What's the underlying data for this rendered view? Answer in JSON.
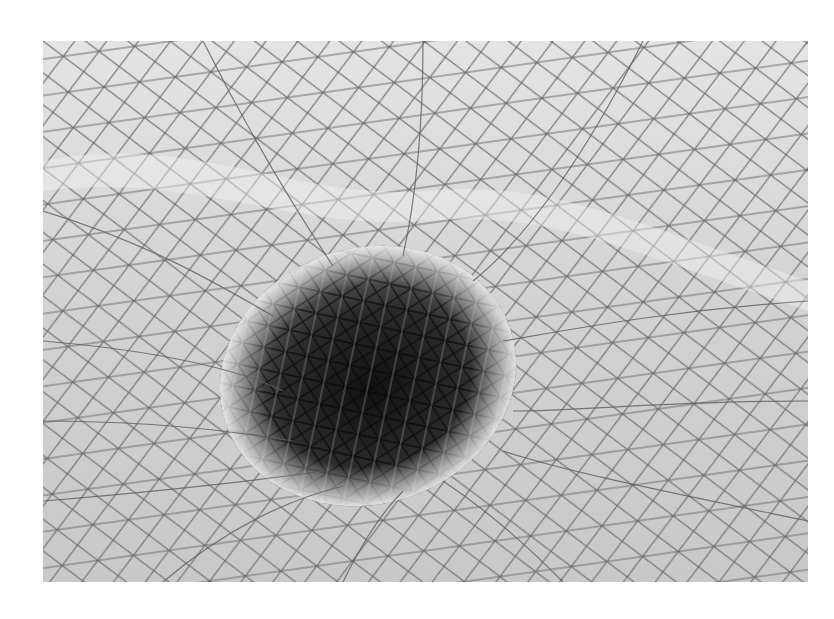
{
  "image": {
    "subject": "glass and steel gridshell roof forming a funnel-shaped vortex",
    "style": "black-and-white photograph",
    "colors": {
      "background": "#ffffff",
      "glass_light": "#e6e6e6",
      "glass_mid": "#bdbdbd",
      "grid_line": "#6a6a6a",
      "funnel_dark": "#2b2b2b",
      "funnel_deep": "#141414"
    },
    "frame": {
      "left": 43,
      "top": 41,
      "width": 765,
      "height": 541
    }
  }
}
